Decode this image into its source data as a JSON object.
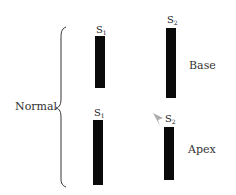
{
  "group_label": "Normal",
  "rows": [
    {
      "name": "Base",
      "s1": {
        "label": "S",
        "sub": "1"
      },
      "s2": {
        "label": "S",
        "sub": "2"
      }
    },
    {
      "name": "Apex",
      "s1": {
        "label": "S",
        "sub": "1"
      },
      "s2": {
        "label": "S",
        "sub": "2"
      }
    }
  ]
}
